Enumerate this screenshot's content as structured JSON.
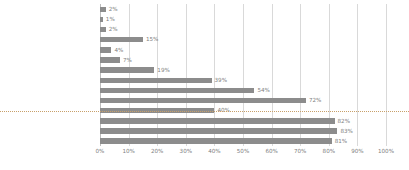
{
  "chart_data": {
    "type": "bar",
    "orientation": "horizontal",
    "title": "",
    "xlabel": "",
    "ylabel": "",
    "xlim": [
      0,
      100
    ],
    "xticks": [
      "0%",
      "10%",
      "20%",
      "30%",
      "40%",
      "50%",
      "60%",
      "70%",
      "80%",
      "90%",
      "100%"
    ],
    "xtick_values": [
      0,
      10,
      20,
      30,
      40,
      50,
      60,
      70,
      80,
      90,
      100
    ],
    "grid": true,
    "legend": false,
    "bar_color": "#8c8c8c",
    "gridline_color": "#d9d9d9",
    "label_color": "#6b6b6b",
    "separator_after_index": 8,
    "categories": [
      "全医療機関",
      "無床診療所",
      "有床診療所",
      "病院",
      "20-100",
      "100-199",
      "200-299",
      "300-399",
      "400-499",
      "500-",
      "200以上",
      "地域医療支援病院",
      "地域医療支援病院（200床以上）",
      "特定機能病院"
    ],
    "values": [
      2,
      1,
      2,
      15,
      4,
      7,
      19,
      39,
      54,
      72,
      40,
      82,
      83,
      81
    ],
    "value_labels": [
      "2%",
      "1%",
      "2%",
      "15%",
      "4%",
      "7%",
      "19%",
      "39%",
      "54%",
      "72%",
      "40%",
      "82%",
      "83%",
      "81%"
    ]
  }
}
